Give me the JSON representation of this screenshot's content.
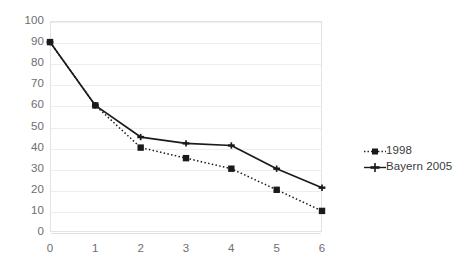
{
  "chart_data": {
    "type": "line",
    "title": "",
    "subtitle": "",
    "xlabel": "",
    "ylabel": "",
    "x": [
      0,
      1,
      2,
      3,
      4,
      5,
      6
    ],
    "categories": [
      "0",
      "1",
      "2",
      "3",
      "4",
      "5",
      "6"
    ],
    "xtick_labels": [
      "0",
      "1",
      "2",
      "3",
      "4",
      "5",
      "6"
    ],
    "ytick_labels": [
      "0",
      "10",
      "20",
      "30",
      "40",
      "50",
      "60",
      "70",
      "80",
      "90",
      "100"
    ],
    "ytick_values": [
      0,
      10,
      20,
      30,
      40,
      50,
      60,
      70,
      80,
      90,
      100
    ],
    "ylim": [
      0,
      100
    ],
    "xlim": [
      0,
      6
    ],
    "grid": "horizontal",
    "legend_position": "right",
    "series": [
      {
        "name": "1998",
        "values": [
          90,
          60,
          40,
          35,
          30,
          20,
          10
        ],
        "line_style": "dotted",
        "marker": "square",
        "color": "#1a1a1a"
      },
      {
        "name": "Bayern 2005",
        "values": [
          90,
          60,
          45,
          42,
          41,
          30,
          21
        ],
        "line_style": "solid",
        "marker": "plus",
        "color": "#1a1a1a"
      }
    ]
  },
  "legend": {
    "entries": [
      {
        "label": "1998"
      },
      {
        "label": "Bayern 2005"
      }
    ]
  },
  "colors": {
    "series_line": "#1a1a1a",
    "gridline": "#ededed",
    "plot_border": "#e3e3e3",
    "tick_text": "#6e6e6e",
    "legend_text": "#3a3a3a",
    "background": "#ffffff"
  }
}
